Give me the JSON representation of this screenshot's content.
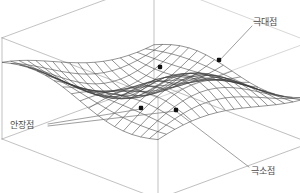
{
  "figure": {
    "title": "",
    "kind": "3d-surface-wireframe",
    "background_color": "#ffffff",
    "mesh_color": "#3a3a3a",
    "box_color": "#9a9a9a",
    "leader_color": "#6e6e6e",
    "marker_color": "#111111",
    "label_color": "#4a4a4a"
  },
  "labels": [
    {
      "id": "max",
      "text": "극대점",
      "x": 253,
      "y": 17,
      "leader": [
        [
          252,
          26
        ],
        [
          219,
          61
        ]
      ]
    },
    {
      "id": "saddle",
      "text": "안장점",
      "x": 10,
      "y": 120,
      "leader_a": [
        [
          48,
          124
        ],
        [
          141,
          109
        ]
      ],
      "leader_b": [
        [
          48,
          126
        ],
        [
          176,
          111
        ]
      ]
    },
    {
      "id": "min",
      "text": "극소점",
      "x": 251,
      "y": 166,
      "leader": [
        [
          249,
          167
        ],
        [
          177,
          112
        ]
      ]
    }
  ],
  "critical_points": [
    {
      "name": "local-maximum",
      "sx": 219,
      "sy": 60,
      "kind": "max"
    },
    {
      "name": "local-maximum-2",
      "sx": 160,
      "sy": 67,
      "kind": "max"
    },
    {
      "name": "saddle-point",
      "sx": 141,
      "sy": 108,
      "kind": "saddle"
    },
    {
      "name": "local-minimum",
      "sx": 176,
      "sy": 110,
      "kind": "min"
    }
  ],
  "chart_data": {
    "type": "surface",
    "title": "",
    "xlabel": "",
    "ylabel": "",
    "zlabel": "",
    "grid": true,
    "legend": false,
    "surface_function": "z = sin(u)*cos(v) blended ridge",
    "u_range": [
      -1,
      1
    ],
    "v_range": [
      -1,
      1
    ],
    "u_divisions": 18,
    "v_divisions": 18,
    "projection": {
      "origin_x": 156,
      "origin_y": 86,
      "ax": 78,
      "ay": 30,
      "bx": -76,
      "by": 28,
      "cz": -44
    },
    "bounding_box": {
      "corners_screen": [
        [
          80,
          62
        ],
        [
          155,
          18
        ],
        [
          238,
          48
        ],
        [
          160,
          98
        ],
        [
          80,
          130
        ],
        [
          238,
          145
        ],
        [
          160,
          167
        ]
      ]
    },
    "annotations": [
      "극대점",
      "안장점",
      "극소점"
    ]
  }
}
